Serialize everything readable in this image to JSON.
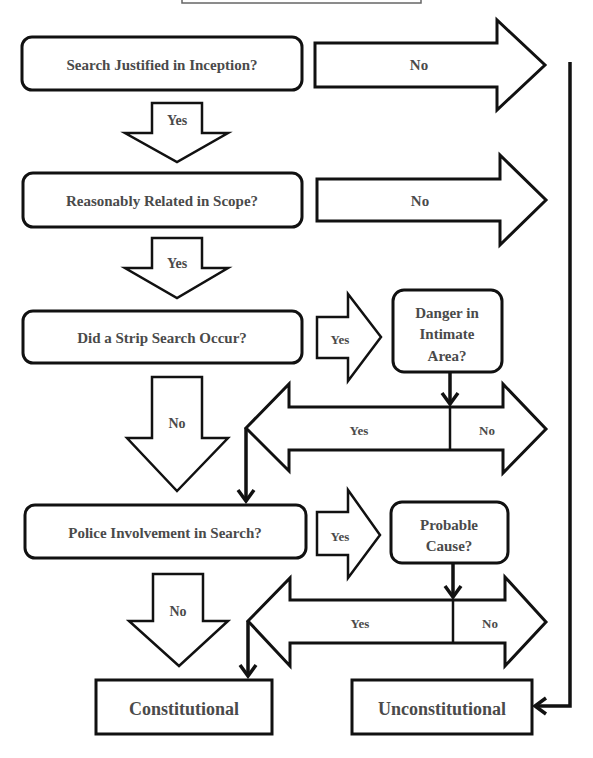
{
  "diagram": {
    "title_box": {
      "text": ""
    },
    "questions": [
      {
        "id": "q1",
        "label": "Search Justified in Inception?"
      },
      {
        "id": "q2",
        "label": "Reasonably Related in Scope?"
      },
      {
        "id": "q3",
        "label": "Did a Strip Search Occur?"
      },
      {
        "id": "q4",
        "label": "Police Involvement in Search?"
      }
    ],
    "sub_questions": [
      {
        "id": "danger",
        "lines": [
          "Danger in",
          "Intimate",
          "Area?"
        ]
      },
      {
        "id": "probable",
        "lines": [
          "Probable",
          "Cause?"
        ]
      }
    ],
    "arrows": {
      "q1_no": "No",
      "q1_yes": "Yes",
      "q2_no": "No",
      "q2_yes": "Yes",
      "q3_yes": "Yes",
      "q3_no": "No",
      "danger_yes": "Yes",
      "danger_no": "No",
      "q4_yes": "Yes",
      "q4_no": "No",
      "probable_yes": "Yes",
      "probable_no": "No"
    },
    "outcomes": {
      "constitutional": "Constitutional",
      "unconstitutional": "Unconstitutional"
    }
  }
}
